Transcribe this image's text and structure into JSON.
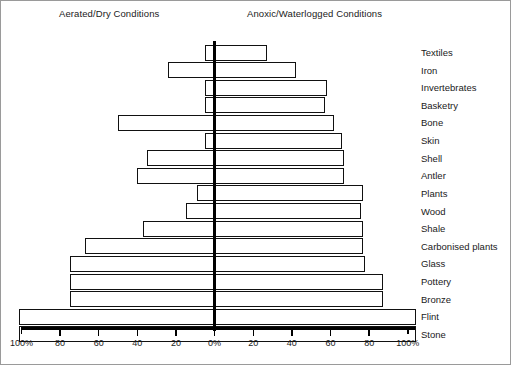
{
  "headers": {
    "left": "Aerated/Dry Conditions",
    "right": "Anoxic/Waterlogged Conditions"
  },
  "axis": {
    "tick_labels": [
      "100%",
      "80",
      "60",
      "40",
      "20",
      "0%",
      "20",
      "40",
      "60",
      "80",
      "100%"
    ],
    "center_value": "0%"
  },
  "chart_data": {
    "type": "bar",
    "title": "",
    "subtitle": "",
    "xlabel": "",
    "ylabel": "",
    "orientation": "horizontal-diverging",
    "xlim": [
      -100,
      100
    ],
    "grid": false,
    "legend": [
      "Aerated/Dry Conditions",
      "Anoxic/Waterlogged Conditions"
    ],
    "legend_position": "top",
    "axis_tick_values": [
      -100,
      -80,
      -60,
      -40,
      -20,
      0,
      20,
      40,
      60,
      80,
      100
    ],
    "axis_tick_labels": [
      "100%",
      "80",
      "60",
      "40",
      "20",
      "0%",
      "20",
      "40",
      "60",
      "80",
      "100%"
    ],
    "categories": [
      "Textiles",
      "Iron",
      "Invertebrates",
      "Basketry",
      "Bone",
      "Skin",
      "Shell",
      "Antler",
      "Plants",
      "Wood",
      "Shale",
      "Carbonised plants",
      "Glass",
      "Pottery",
      "Bronze",
      "Flint",
      "Stone"
    ],
    "series": [
      {
        "name": "Aerated/Dry Conditions",
        "values": [
          5,
          24,
          5,
          5,
          50,
          5,
          35,
          40,
          9,
          15,
          37,
          67,
          75,
          75,
          75,
          101,
          101
        ]
      },
      {
        "name": "Anoxic/Waterlogged Conditions",
        "values": [
          27,
          42,
          58,
          57,
          62,
          66,
          67,
          67,
          77,
          76,
          77,
          77,
          78,
          87,
          87,
          104,
          104
        ]
      }
    ]
  },
  "rows": [
    {
      "label": "Textiles",
      "left": 5,
      "right": 27
    },
    {
      "label": "Iron",
      "left": 24,
      "right": 42
    },
    {
      "label": "Invertebrates",
      "left": 5,
      "right": 58
    },
    {
      "label": "Basketry",
      "left": 5,
      "right": 57
    },
    {
      "label": "Bone",
      "left": 50,
      "right": 62
    },
    {
      "label": "Skin",
      "left": 5,
      "right": 66
    },
    {
      "label": "Shell",
      "left": 35,
      "right": 67
    },
    {
      "label": "Antler",
      "left": 40,
      "right": 67
    },
    {
      "label": "Plants",
      "left": 9,
      "right": 77
    },
    {
      "label": "Wood",
      "left": 15,
      "right": 76
    },
    {
      "label": "Shale",
      "left": 37,
      "right": 77
    },
    {
      "label": "Carbonised plants",
      "left": 67,
      "right": 77
    },
    {
      "label": "Glass",
      "left": 75,
      "right": 78
    },
    {
      "label": "Pottery",
      "left": 75,
      "right": 87
    },
    {
      "label": "Bronze",
      "left": 75,
      "right": 87
    },
    {
      "label": "Flint",
      "left": 101,
      "right": 104
    },
    {
      "label": "Stone",
      "left": 101,
      "right": 104
    }
  ]
}
